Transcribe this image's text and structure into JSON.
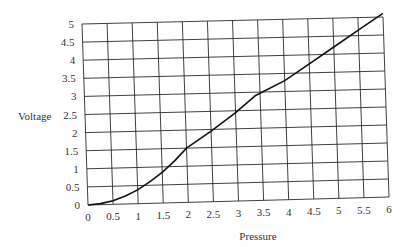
{
  "chart_data": {
    "type": "line",
    "title": "",
    "xlabel": "Pressure",
    "ylabel": "Voltage",
    "xlim": [
      0,
      6
    ],
    "ylim": [
      0,
      5
    ],
    "grid": true,
    "legend": null,
    "x_ticks": [
      "0",
      "0.5",
      "1",
      "1.5",
      "2",
      "2.5",
      "3",
      "3.5",
      "4",
      "4.5",
      "5",
      "5.5",
      "6"
    ],
    "y_ticks": [
      "0",
      "0.5",
      "1",
      "1.5",
      "2",
      "2.5",
      "3",
      "3.5",
      "4",
      "4.5",
      "5"
    ],
    "series": [
      {
        "name": "Voltage vs Pressure",
        "x": [
          0,
          0.25,
          0.5,
          0.75,
          1.0,
          1.25,
          1.5,
          1.75,
          2.0,
          2.5,
          3.0,
          3.4,
          4.0,
          4.5,
          5.0,
          5.5,
          6.0
        ],
        "y": [
          0,
          0.03,
          0.1,
          0.22,
          0.38,
          0.6,
          0.85,
          1.15,
          1.5,
          1.95,
          2.45,
          2.9,
          3.3,
          3.75,
          4.2,
          4.65,
          5.1
        ]
      }
    ]
  }
}
